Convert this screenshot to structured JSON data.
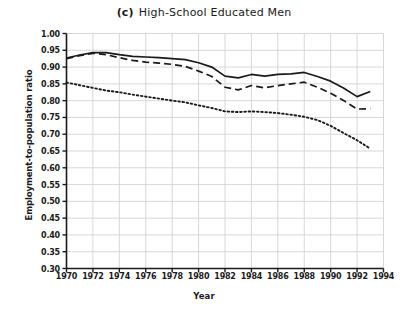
{
  "chart_data": {
    "type": "line",
    "title": "High-School Educated Men",
    "panel_tag": "(c)",
    "xlabel": "Year",
    "ylabel": "Employment-to-population ratio",
    "xlim": [
      1970,
      1994
    ],
    "ylim": [
      0.3,
      1.0
    ],
    "grid": true,
    "legend_position": "none",
    "xticks": [
      1970,
      1972,
      1974,
      1976,
      1978,
      1980,
      1982,
      1984,
      1986,
      1988,
      1990,
      1992,
      1994
    ],
    "xtick_labels": [
      "1970",
      "1972",
      "1974",
      "1976",
      "1978",
      "1980",
      "1982",
      "1984",
      "1986",
      "1988",
      "1990",
      "1992",
      "1994"
    ],
    "yticks": [
      1.0,
      0.95,
      0.9,
      0.85,
      0.8,
      0.75,
      0.7,
      0.65,
      0.6,
      0.55,
      0.5,
      0.45,
      0.4,
      0.35,
      0.3
    ],
    "ytick_labels": [
      "1.00",
      "0.95",
      "0.90",
      "0.85",
      "0.80",
      "0.75",
      "0.70",
      "0.65",
      "0.60",
      "0.55",
      "0.50",
      "0.45",
      "0.40",
      "0.35",
      "0.30"
    ],
    "x": [
      1970,
      1971,
      1972,
      1973,
      1974,
      1975,
      1976,
      1977,
      1978,
      1979,
      1980,
      1981,
      1982,
      1983,
      1984,
      1985,
      1986,
      1987,
      1988,
      1989,
      1990,
      1991,
      1992,
      1993
    ],
    "series": [
      {
        "name": "solid",
        "style": "solid",
        "color": "#1a1a1a",
        "values": [
          0.927,
          0.936,
          0.943,
          0.943,
          0.937,
          0.932,
          0.93,
          0.928,
          0.925,
          0.922,
          0.913,
          0.9,
          0.873,
          0.868,
          0.878,
          0.873,
          0.878,
          0.88,
          0.884,
          0.872,
          0.858,
          0.837,
          0.812,
          0.827
        ]
      },
      {
        "name": "dashed",
        "style": "dashed",
        "color": "#1a1a1a",
        "values": [
          0.925,
          0.934,
          0.941,
          0.937,
          0.928,
          0.92,
          0.915,
          0.912,
          0.908,
          0.902,
          0.888,
          0.872,
          0.84,
          0.832,
          0.845,
          0.838,
          0.845,
          0.85,
          0.855,
          0.84,
          0.822,
          0.8,
          0.775,
          0.776
        ]
      },
      {
        "name": "dotted",
        "style": "dotted",
        "color": "#1a1a1a",
        "values": [
          0.854,
          0.846,
          0.838,
          0.83,
          0.825,
          0.818,
          0.812,
          0.806,
          0.8,
          0.795,
          0.786,
          0.778,
          0.768,
          0.766,
          0.768,
          0.766,
          0.763,
          0.758,
          0.752,
          0.742,
          0.725,
          0.703,
          0.682,
          0.657
        ]
      }
    ]
  }
}
